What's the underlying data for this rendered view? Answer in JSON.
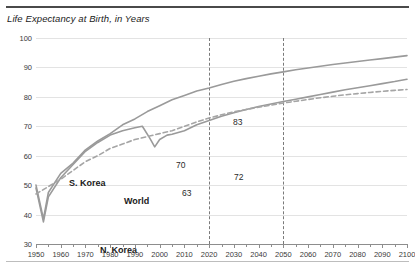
{
  "chart_data": {
    "type": "line",
    "title": "Life Expectancy at Birth, in Years",
    "xlabel": "",
    "ylabel": "",
    "xlim": [
      1950,
      2100
    ],
    "ylim": [
      30,
      100
    ],
    "ytick_step": 10,
    "xtick_step": 10,
    "x_minor_step": 5,
    "grid": true,
    "legend_position": "inline-labels",
    "yticks": [
      "100",
      "90",
      "80",
      "70",
      "60",
      "50",
      "40",
      "30"
    ],
    "xticks": [
      "1950",
      "1960",
      "1970",
      "1980",
      "1990",
      "2000",
      "2010",
      "2020",
      "2030",
      "2040",
      "2050",
      "2060",
      "2070",
      "2080",
      "2090",
      "2100"
    ],
    "vertical_markers": [
      2020,
      2050
    ],
    "series": [
      {
        "name": "S. Korea",
        "style": "solid",
        "color": "#9a9a9a",
        "x": [
          1950,
          1953,
          1955,
          1960,
          1965,
          1970,
          1975,
          1980,
          1985,
          1990,
          1995,
          2000,
          2005,
          2010,
          2015,
          2020,
          2025,
          2030,
          2035,
          2040,
          2045,
          2050,
          2055,
          2060,
          2065,
          2070,
          2075,
          2080,
          2085,
          2090,
          2095,
          2100
        ],
        "values": [
          50.0,
          38.5,
          47.5,
          54.0,
          57.5,
          62.0,
          65.0,
          67.5,
          70.5,
          72.5,
          75.0,
          77.0,
          79.0,
          80.5,
          82.0,
          83.0,
          84.2,
          85.3,
          86.2,
          87.0,
          87.8,
          88.5,
          89.2,
          89.8,
          90.4,
          91.0,
          91.5,
          92.0,
          92.5,
          93.0,
          93.5,
          94.0
        ]
      },
      {
        "name": "N. Korea",
        "style": "solid",
        "color": "#9a9a9a",
        "x": [
          1950,
          1953,
          1955,
          1960,
          1965,
          1970,
          1975,
          1980,
          1985,
          1990,
          1993,
          1996,
          1998,
          2000,
          2003,
          2005,
          2010,
          2015,
          2020,
          2025,
          2030,
          2035,
          2040,
          2045,
          2050,
          2055,
          2060,
          2065,
          2070,
          2075,
          2080,
          2085,
          2090,
          2095,
          2100
        ],
        "values": [
          49.0,
          37.5,
          46.0,
          52.5,
          57.0,
          61.5,
          64.5,
          67.0,
          68.5,
          69.5,
          70.0,
          66.0,
          63.0,
          65.5,
          67.0,
          67.3,
          68.5,
          70.5,
          72.0,
          73.4,
          74.6,
          75.7,
          76.7,
          77.6,
          78.4,
          79.2,
          80.0,
          80.8,
          81.6,
          82.4,
          83.1,
          83.8,
          84.5,
          85.2,
          86.0
        ]
      },
      {
        "name": "World",
        "style": "dashed",
        "color": "#a5a5a5",
        "x": [
          1950,
          1955,
          1960,
          1965,
          1970,
          1975,
          1980,
          1985,
          1990,
          1995,
          2000,
          2005,
          2010,
          2015,
          2020,
          2025,
          2030,
          2035,
          2040,
          2045,
          2050,
          2055,
          2060,
          2065,
          2070,
          2075,
          2080,
          2085,
          2090,
          2095,
          2100
        ],
        "values": [
          47.0,
          49.5,
          52.0,
          55.0,
          58.0,
          60.0,
          62.5,
          64.0,
          65.5,
          66.5,
          67.5,
          68.5,
          70.0,
          71.5,
          72.8,
          73.9,
          74.9,
          75.7,
          76.5,
          77.2,
          77.9,
          78.5,
          79.1,
          79.7,
          80.2,
          80.7,
          81.1,
          81.5,
          81.9,
          82.2,
          82.5
        ]
      }
    ],
    "series_labels": [
      {
        "text": "S. Korea",
        "x_px": 33,
        "y_px": 140
      },
      {
        "text": "World",
        "x_px": 88,
        "y_px": 158
      },
      {
        "text": "N. Korea",
        "x_px": 64,
        "y_px": 207
      }
    ],
    "annotations": [
      {
        "text": "83",
        "x_px": 197,
        "y_px": 79
      },
      {
        "text": "70",
        "x_px": 140,
        "y_px": 122
      },
      {
        "text": "63",
        "x_px": 146,
        "y_px": 150
      },
      {
        "text": "72",
        "x_px": 198,
        "y_px": 134
      }
    ]
  }
}
